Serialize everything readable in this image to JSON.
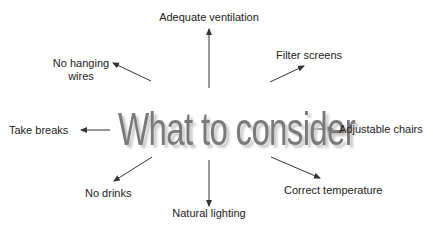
{
  "diagram": {
    "title": "What to consider",
    "colors": {
      "title_fill": "#7a7a7a",
      "title_shadow": "#c9c9c9",
      "arrow": "#333333",
      "label_text": "#222222",
      "background": "#ffffff"
    },
    "items": [
      {
        "id": "top",
        "label": "Adequate ventilation",
        "direction": "up"
      },
      {
        "id": "top-right",
        "label": "Filter screens",
        "direction": "up-right"
      },
      {
        "id": "right",
        "label": "Adjustable chairs",
        "direction": "right"
      },
      {
        "id": "bottom-right",
        "label": "Correct temperature",
        "direction": "down-right"
      },
      {
        "id": "bottom",
        "label": "Natural lighting",
        "direction": "down"
      },
      {
        "id": "bottom-left",
        "label": "No drinks",
        "direction": "down-left"
      },
      {
        "id": "left",
        "label": "Take breaks",
        "direction": "left"
      },
      {
        "id": "top-left",
        "label": "No hanging\nwires",
        "label_lines": [
          "No hanging",
          "wires"
        ],
        "direction": "up-left"
      }
    ]
  }
}
